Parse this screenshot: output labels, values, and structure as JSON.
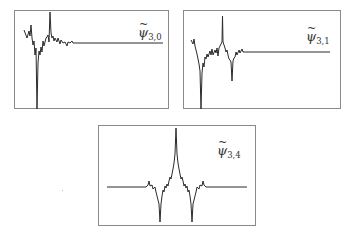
{
  "figure": {
    "panels": [
      {
        "id": "psi-3-0",
        "label": {
          "symbol": "ψ",
          "tilde": "~",
          "subscript": "3,0"
        },
        "box": {
          "x": 14,
          "y": 10,
          "w": 155,
          "h": 99
        },
        "baseline_y": 32,
        "line_end_x": 148,
        "points": "9,19 12,27 14,20 15,25 16,14 17,27 18,34 19,30 20,44 21,37 22,98 23,52 24,40 25,44 26,36 27,41 28,30 29,35 31,27 32,26 33,24 34,31 35,1 36,22 37,27 38,25 39,30 40,27 42,31 43,27 45,33 46,29 48,32 50,31 52,35 53,31 55,32 57,30 58,32 60,32 148,32"
      },
      {
        "id": "psi-3-1",
        "label": {
          "symbol": "ψ",
          "tilde": "~",
          "subscript": "3,1"
        },
        "box": {
          "x": 183,
          "y": 10,
          "w": 158,
          "h": 99
        },
        "baseline_y": 41,
        "line_end_x": 146,
        "points": "7,29 9,33 10,28 11,35 12,39 13,43 14,48 15,53 16,60 17,98 18,62 19,52 20,56 21,46 22,48 23,43 24,46 26,40 27,44 28,38 29,44 31,39 32,42 33,37 34,45 35,37 36,35 37,33 38,31 38.5,5 39,31 40,34 41,37 42,41 43,39 44,44 45,48 46,49 47,51 48,70 49,50 50,47 51,46 52,41 53,44 55,39 56,42 57,40 58,38 59,41 61,41 146,41"
      },
      {
        "id": "psi-3-4",
        "label": {
          "symbol": "ψ",
          "tilde": "~",
          "subscript": "3,4"
        },
        "box": {
          "x": 98,
          "y": 125,
          "w": 158,
          "h": 101
        },
        "baseline_y": 61,
        "line_end_x": 148,
        "points": "8,61 47,61 49,59 50,55 51,60 53,59 54,63 56,61 57,66 58,70 59,74 60,78 61,96 62,78 63,70 64,64 65,66 66,60 67,62 68,58 69,60 70,55 71,51 72,53 73,48 74,43 75,37 76,28 77,2 78,28 79,37 80,43 81,48 82,53 83,51 84,55 85,60 86,58 87,62 88,60 89,66 90,64 91,70 92,78 93,96 94,78 95,74 96,70 97,66 98,61 100,63 101,59 103,60 104,55 105,59 107,61 108,61 148,61"
      }
    ],
    "stroke_color": "#2b2b2b",
    "border_color": "#8a8a8a"
  }
}
